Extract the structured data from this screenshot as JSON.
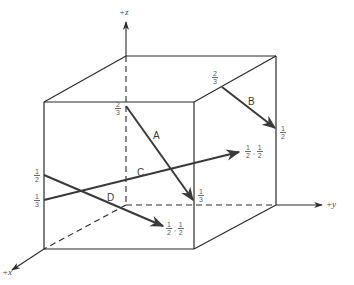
{
  "diagram": {
    "type": "unit-cube-directions",
    "axes": {
      "z": {
        "label": "+z"
      },
      "y": {
        "label": "+y"
      },
      "x": {
        "label": "+x"
      }
    },
    "vectors": [
      {
        "name": "A",
        "label": "A",
        "start_label": {
          "num": "2",
          "den": "3"
        },
        "end_label": {
          "num": "1",
          "den": "3"
        }
      },
      {
        "name": "B",
        "label": "B",
        "start_label": {
          "num": "2",
          "den": "3"
        },
        "end_label": {
          "num": "1",
          "den": "2"
        }
      },
      {
        "name": "C",
        "label": "C",
        "start_label": {
          "num": "1",
          "den": "3"
        },
        "end_label": [
          {
            "num": "1",
            "den": "2"
          },
          {
            "num": "1",
            "den": "2"
          }
        ]
      },
      {
        "name": "D",
        "label": "D",
        "start_label": {
          "num": "1",
          "den": "2"
        },
        "end_label": [
          {
            "num": "1",
            "den": "2"
          },
          {
            "num": "1",
            "den": "2"
          }
        ]
      }
    ],
    "separator": ","
  }
}
